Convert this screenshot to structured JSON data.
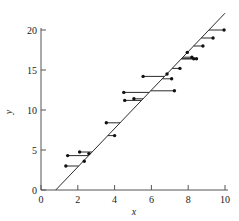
{
  "chart_data": {
    "type": "scatter",
    "title": "",
    "subtitle": "",
    "xlabel": "x",
    "ylabel": "y",
    "xlim": [
      0,
      10
    ],
    "ylim": [
      0,
      20
    ],
    "xticks": [
      0,
      2,
      4,
      6,
      8,
      10
    ],
    "yticks": [
      0,
      5,
      10,
      15,
      20
    ],
    "xtick_labels": [
      "0",
      "2",
      "4",
      "6",
      "8",
      "10"
    ],
    "ytick_labels": [
      "0",
      "5",
      "10",
      "15",
      "20"
    ],
    "grid": false,
    "legend": null,
    "series": [
      {
        "name": "observations",
        "marker": "filled-circle",
        "color": "#111111",
        "points": [
          {
            "x": 1.35,
            "y": 3.0
          },
          {
            "x": 1.45,
            "y": 4.3
          },
          {
            "x": 2.1,
            "y": 4.75
          },
          {
            "x": 2.35,
            "y": 3.6
          },
          {
            "x": 2.6,
            "y": 4.55
          },
          {
            "x": 3.55,
            "y": 8.4
          },
          {
            "x": 4.0,
            "y": 6.8
          },
          {
            "x": 4.5,
            "y": 12.2
          },
          {
            "x": 4.55,
            "y": 11.2
          },
          {
            "x": 5.05,
            "y": 11.4
          },
          {
            "x": 5.55,
            "y": 14.2
          },
          {
            "x": 6.85,
            "y": 14.5
          },
          {
            "x": 7.1,
            "y": 13.9
          },
          {
            "x": 7.25,
            "y": 12.4
          },
          {
            "x": 7.55,
            "y": 15.2
          },
          {
            "x": 7.95,
            "y": 17.2
          },
          {
            "x": 8.2,
            "y": 16.6
          },
          {
            "x": 8.3,
            "y": 16.4
          },
          {
            "x": 8.45,
            "y": 16.4
          },
          {
            "x": 8.8,
            "y": 18.0
          },
          {
            "x": 9.35,
            "y": 19.0
          },
          {
            "x": 9.95,
            "y": 20.0
          }
        ]
      }
    ],
    "fit_line": {
      "name": "least-squares fit",
      "color": "#2b2b2b",
      "x_start": 0.8,
      "y_start": 0.0,
      "x_end": 10.0,
      "y_end": 22.1
    },
    "residual_stems": {
      "name": "residual connectors",
      "color": "#2b2b2b",
      "description": "vertical-to-line segments joining each observation to the fitted line"
    }
  },
  "figure": {
    "background_color": "#ffffff",
    "axis_color": "#555555",
    "marker_color": "#111111",
    "line_color": "#2b2b2b"
  }
}
